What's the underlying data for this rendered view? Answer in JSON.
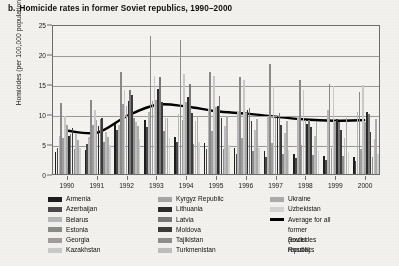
{
  "figure": {
    "label": "b.",
    "title": "Homicide rates in former Soviet republics, 1990–2000"
  },
  "chart_data": {
    "type": "bar",
    "title": "Homicide rates in former Soviet republics, 1990–2000",
    "xlabel": "",
    "ylabel": "Homicides (per 100,000 population)",
    "ylim": [
      0,
      25
    ],
    "yticks": [
      0,
      5,
      10,
      15,
      20,
      25
    ],
    "grid": true,
    "legend_position": "below",
    "categories": [
      "1990",
      "1991",
      "1992",
      "1993",
      "1994",
      "1995",
      "1996",
      "1997",
      "1998",
      "1999",
      "2000"
    ],
    "series": [
      {
        "name": "Armenia",
        "color": "#1d1d1d",
        "values": [
          3.6,
          4.0,
          8.4,
          9.0,
          6.2,
          5.2,
          4.4,
          3.8,
          3.4,
          3.0,
          2.8
        ]
      },
      {
        "name": "Azerbaijan",
        "color": "#4a4a4a",
        "values": [
          4.4,
          5.0,
          7.4,
          7.8,
          5.4,
          4.2,
          3.4,
          2.8,
          2.6,
          2.4,
          2.2
        ]
      },
      {
        "name": "Belarus",
        "color": "#b7b7b7",
        "values": [
          6.4,
          6.2,
          8.2,
          10.4,
          10.0,
          10.8,
          10.4,
          9.6,
          9.4,
          10.6,
          10.4
        ]
      },
      {
        "name": "Estonia",
        "color": "#8a8a8a",
        "values": [
          11.8,
          12.4,
          17.0,
          23.0,
          22.4,
          17.0,
          16.2,
          18.4,
          15.6,
          15.0,
          13.6
        ]
      },
      {
        "name": "Georgia",
        "color": "#9e9e9e",
        "values": [
          6.0,
          8.2,
          11.6,
          12.2,
          9.0,
          7.2,
          6.0,
          5.2,
          4.8,
          4.4,
          4.2
        ]
      },
      {
        "name": "Kazakhstan",
        "color": "#c9c9c9",
        "values": [
          9.6,
          10.6,
          14.0,
          16.4,
          16.6,
          16.4,
          15.6,
          14.6,
          14.0,
          14.6,
          14.8
        ]
      },
      {
        "name": "Kyrgyz Republic",
        "color": "#a5a5a5",
        "values": [
          8.2,
          9.0,
          11.4,
          12.4,
          12.0,
          11.2,
          10.2,
          9.4,
          9.0,
          8.8,
          8.6
        ]
      },
      {
        "name": "Lithuania",
        "color": "#2b2b2b",
        "values": [
          6.4,
          8.0,
          12.2,
          14.2,
          12.8,
          11.4,
          10.6,
          9.6,
          8.4,
          9.2,
          10.4
        ]
      },
      {
        "name": "Latvia",
        "color": "#787878",
        "values": [
          6.6,
          9.2,
          14.0,
          16.2,
          15.0,
          13.0,
          11.0,
          10.2,
          9.0,
          8.6,
          10.0
        ]
      },
      {
        "name": "Moldova",
        "color": "#3c3c3c",
        "values": [
          7.6,
          9.4,
          13.2,
          12.0,
          10.2,
          9.4,
          8.8,
          8.2,
          7.8,
          7.4,
          7.0
        ]
      },
      {
        "name": "Tajikistan",
        "color": "#8f8f8f",
        "values": [
          4.2,
          5.4,
          9.4,
          7.2,
          5.0,
          4.2,
          3.8,
          3.4,
          3.2,
          3.0,
          2.8
        ]
      },
      {
        "name": "Turkmenistan",
        "color": "#bdbdbd",
        "values": [
          6.8,
          7.0,
          8.6,
          9.4,
          8.8,
          8.0,
          7.4,
          6.8,
          6.4,
          6.0,
          5.8
        ]
      },
      {
        "name": "Ukraine",
        "color": "#ababab",
        "values": [
          5.6,
          6.2,
          8.0,
          9.4,
          9.6,
          9.6,
          9.2,
          8.8,
          8.6,
          9.4,
          9.2
        ]
      },
      {
        "name": "Uzbekistan",
        "color": "#d2d2d2",
        "values": [
          4.4,
          4.8,
          5.8,
          6.0,
          5.4,
          4.8,
          4.4,
          4.0,
          3.8,
          3.6,
          3.4
        ]
      }
    ],
    "average_series": {
      "name": "Average for all former Soviet republics (excludes Russia)",
      "color": "#000000",
      "values": [
        7.3,
        7.0,
        9.8,
        11.7,
        11.4,
        10.6,
        10.2,
        9.7,
        9.2,
        9.0,
        9.1
      ]
    }
  },
  "axes": {
    "y_title": "Homicides (per 100,000 population)",
    "y_ticks": [
      "0",
      "5",
      "10",
      "15",
      "20",
      "25"
    ],
    "x_ticks": [
      "1990",
      "1991",
      "1992",
      "1993",
      "1994",
      "1995",
      "1996",
      "1997",
      "1998",
      "1999",
      "2000"
    ]
  },
  "legend": {
    "columns": [
      {
        "items": [
          {
            "label": "Armenia",
            "color": "#1d1d1d"
          },
          {
            "label": "Azerbaijan",
            "color": "#4a4a4a"
          },
          {
            "label": "Belarus",
            "color": "#b7b7b7"
          },
          {
            "label": "Estonia",
            "color": "#8a8a8a"
          },
          {
            "label": "Georgia",
            "color": "#9e9e9e"
          },
          {
            "label": "Kazakhstan",
            "color": "#c9c9c9"
          }
        ]
      },
      {
        "items": [
          {
            "label": "Kyrgyz Republic",
            "color": "#a5a5a5"
          },
          {
            "label": "Lithuania",
            "color": "#2b2b2b"
          },
          {
            "label": "Latvia",
            "color": "#787878"
          },
          {
            "label": "Moldova",
            "color": "#3c3c3c"
          },
          {
            "label": "Tajikistan",
            "color": "#8f8f8f"
          },
          {
            "label": "Turkmenistan",
            "color": "#bdbdbd"
          }
        ]
      },
      {
        "items": [
          {
            "label": "Ukraine",
            "color": "#ababab"
          },
          {
            "label": "Uzbekistan",
            "color": "#d2d2d2"
          }
        ],
        "average": {
          "color": "#000000",
          "line1": "Average for all",
          "line2": "former Soviet republics",
          "line3": "(excludes Russia)"
        }
      }
    ]
  }
}
